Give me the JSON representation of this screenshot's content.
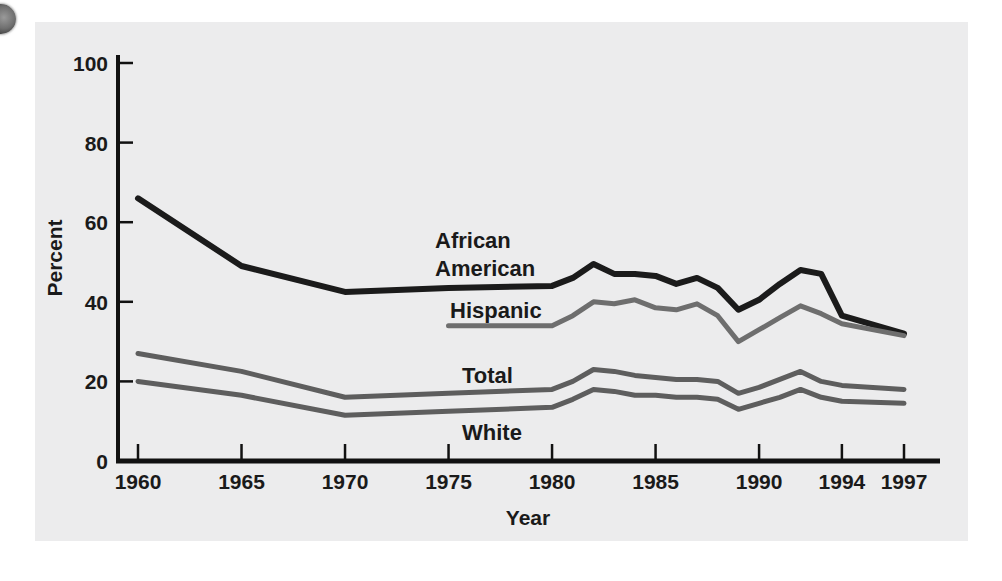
{
  "figure": {
    "background_color": "#ffffff",
    "panel_color": "#ececed",
    "axis_color": "#111111"
  },
  "axes": {
    "y_title": "Percent",
    "x_title": "Year",
    "y_ticks": [
      "0",
      "20",
      "40",
      "60",
      "80",
      "100"
    ],
    "x_ticks": [
      "1960",
      "1965",
      "1970",
      "1975",
      "1980",
      "1985",
      "1990",
      "1994",
      "1997"
    ]
  },
  "labels": {
    "african_american_line1": "African",
    "african_american_line2": "American",
    "hispanic": "Hispanic",
    "total": "Total",
    "white": "White"
  },
  "chart_data": {
    "type": "line",
    "title": "",
    "xlabel": "Year",
    "ylabel": "Percent",
    "xlim": [
      1960,
      1997
    ],
    "ylim": [
      0,
      100
    ],
    "grid": false,
    "legend": "inline-labels",
    "colors": {
      "African American": "#1b1b1b",
      "Hispanic": "#6e6e6e",
      "Total": "#5e5e5e",
      "White": "#5e5e5e"
    },
    "series": [
      {
        "name": "African American",
        "color": "#1b1b1b",
        "x": [
          1960,
          1965,
          1970,
          1975,
          1980,
          1981,
          1982,
          1983,
          1984,
          1985,
          1986,
          1987,
          1988,
          1989,
          1990,
          1991,
          1992,
          1993,
          1994,
          1997
        ],
        "values": [
          66,
          49,
          42.5,
          43.5,
          44,
          46,
          49.5,
          47,
          47,
          46.5,
          44.5,
          46,
          43.5,
          38,
          40.5,
          44.5,
          48,
          47,
          36.5,
          32
        ]
      },
      {
        "name": "Hispanic",
        "color": "#6e6e6e",
        "x": [
          1975,
          1980,
          1981,
          1982,
          1983,
          1984,
          1985,
          1986,
          1987,
          1988,
          1989,
          1990,
          1991,
          1992,
          1993,
          1994,
          1997
        ],
        "values": [
          34,
          34,
          36.5,
          40,
          39.5,
          40.5,
          38.5,
          38,
          39.5,
          36.5,
          30,
          33,
          36,
          39,
          37,
          34.5,
          31.5
        ]
      },
      {
        "name": "Total",
        "color": "#5e5e5e",
        "x": [
          1960,
          1965,
          1970,
          1975,
          1980,
          1981,
          1982,
          1983,
          1984,
          1985,
          1986,
          1987,
          1988,
          1989,
          1990,
          1991,
          1992,
          1993,
          1994,
          1997
        ],
        "values": [
          27,
          22.5,
          16,
          17,
          18,
          20,
          23,
          22.5,
          21.5,
          21,
          20.5,
          20.5,
          20,
          17,
          18.5,
          20.5,
          22.5,
          20,
          19,
          18
        ]
      },
      {
        "name": "White",
        "color": "#5e5e5e",
        "x": [
          1960,
          1965,
          1970,
          1975,
          1980,
          1981,
          1982,
          1983,
          1984,
          1985,
          1986,
          1987,
          1988,
          1989,
          1990,
          1991,
          1992,
          1993,
          1994,
          1997
        ],
        "values": [
          20,
          16.5,
          11.5,
          12.5,
          13.5,
          15.5,
          18,
          17.5,
          16.5,
          16.5,
          16,
          16,
          15.5,
          13,
          14.5,
          16,
          18,
          16,
          15,
          14.5
        ]
      }
    ]
  }
}
